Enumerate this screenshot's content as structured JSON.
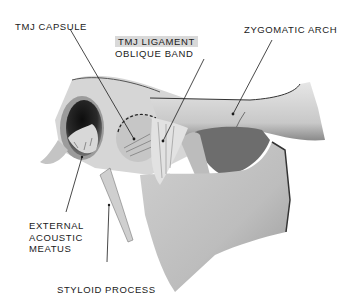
{
  "figure": {
    "labels": {
      "tmj_capsule": "TMJ CAPSULE",
      "tmj_ligament_line1": "TMJ LIGAMENT",
      "tmj_ligament_line2": "OBLIQUE BAND",
      "zygomatic_arch": "ZYGOMATIC ARCH",
      "external_acoustic_line1": "EXTERNAL",
      "external_acoustic_line2": "ACOUSTIC",
      "external_acoustic_line3": "MEATUS",
      "styloid_process": "STYLOID PROCESS"
    },
    "colors": {
      "background": "#ffffff",
      "bone_light": "#dcdcdc",
      "bone_mid": "#b4b4b4",
      "bone_dark": "#6e6e6e",
      "shadow": "#2a2a2a",
      "label_highlight": "#d9d9d9",
      "leader_line": "#1a1a1a"
    }
  }
}
